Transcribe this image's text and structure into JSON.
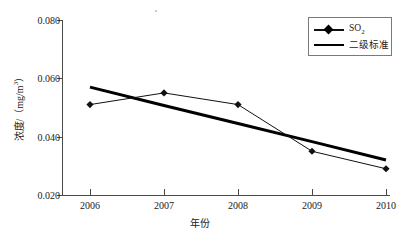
{
  "chart_data": {
    "type": "line",
    "title": "",
    "xlabel": "年份",
    "ylabel": "浓度/（mg/m³）",
    "ylabel_parts": {
      "prefix": "浓度/（mg/m",
      "exponent": "3",
      "suffix": "）"
    },
    "categories": [
      "2006",
      "2007",
      "2008",
      "2009",
      "2010"
    ],
    "x": [
      2006,
      2007,
      2008,
      2009,
      2010
    ],
    "xlim": [
      2005.55,
      2010.75
    ],
    "ylim": [
      0.02,
      0.08
    ],
    "ytick_labels": [
      "0.080",
      "0.060",
      "0.040",
      "0.020"
    ],
    "ytick_values": [
      0.08,
      0.06,
      0.04,
      0.02
    ],
    "grid": false,
    "legend_position": "top-right",
    "series": [
      {
        "name": "SO2",
        "name_display_base": "SO",
        "name_display_sub": "2",
        "values": [
          0.051,
          0.055,
          0.051,
          0.035,
          0.029
        ],
        "marker": "diamond",
        "color": "#111111",
        "line_width": 1
      },
      {
        "name": "二级标准",
        "values": [
          0.057,
          0.0507,
          0.0445,
          0.0383,
          0.032
        ],
        "marker": "none",
        "color": "#000000",
        "line_width": 3
      }
    ]
  },
  "legend": {
    "items": [
      {
        "label_base": "SO",
        "label_sub": "2",
        "symbol": "diamond-line"
      },
      {
        "label": "二级标准",
        "symbol": "thick-line"
      }
    ]
  },
  "colors": {
    "axis": "#4a4a4a",
    "series_so2": "#111111",
    "series_standard": "#000000",
    "background": "#ffffff",
    "legend_border": "#7a7a7a"
  }
}
